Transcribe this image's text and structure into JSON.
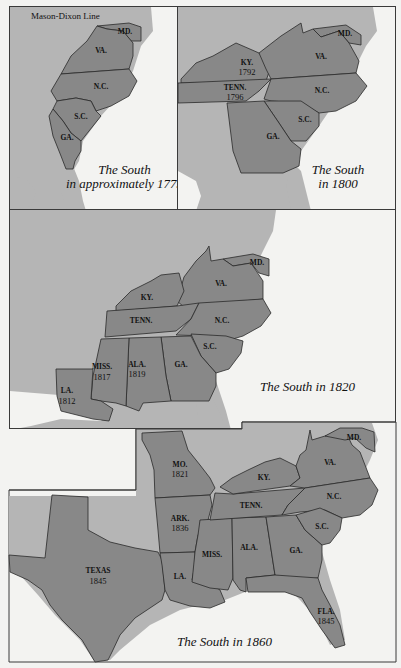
{
  "colors": {
    "water": "#f3f3f1",
    "land": "#b5b5b5",
    "state": "#888888",
    "border": "#2a2a2a"
  },
  "maps": [
    {
      "id": "south-1775",
      "caption_line1": "The South",
      "caption_line2": "in approximately 1775",
      "annotation": "Mason-Dixon Line",
      "states": [
        {
          "abbr": "MD.",
          "year": ""
        },
        {
          "abbr": "VA.",
          "year": ""
        },
        {
          "abbr": "N.C.",
          "year": ""
        },
        {
          "abbr": "S.C.",
          "year": ""
        },
        {
          "abbr": "GA.",
          "year": ""
        }
      ]
    },
    {
      "id": "south-1800",
      "caption_line1": "The South",
      "caption_line2": "in 1800",
      "states": [
        {
          "abbr": "MD.",
          "year": ""
        },
        {
          "abbr": "VA.",
          "year": ""
        },
        {
          "abbr": "KY.",
          "year": "1792"
        },
        {
          "abbr": "TENN.",
          "year": "1796"
        },
        {
          "abbr": "N.C.",
          "year": ""
        },
        {
          "abbr": "S.C.",
          "year": ""
        },
        {
          "abbr": "GA.",
          "year": ""
        }
      ]
    },
    {
      "id": "south-1820",
      "caption": "The South in 1820",
      "states": [
        {
          "abbr": "MD.",
          "year": ""
        },
        {
          "abbr": "VA.",
          "year": ""
        },
        {
          "abbr": "KY.",
          "year": ""
        },
        {
          "abbr": "TENN.",
          "year": ""
        },
        {
          "abbr": "N.C.",
          "year": ""
        },
        {
          "abbr": "S.C.",
          "year": ""
        },
        {
          "abbr": "GA.",
          "year": ""
        },
        {
          "abbr": "ALA.",
          "year": "1819"
        },
        {
          "abbr": "MISS.",
          "year": "1817"
        },
        {
          "abbr": "LA.",
          "year": "1812"
        }
      ]
    },
    {
      "id": "south-1860",
      "caption": "The South in 1860",
      "states": [
        {
          "abbr": "MD.",
          "year": ""
        },
        {
          "abbr": "VA.",
          "year": ""
        },
        {
          "abbr": "KY.",
          "year": ""
        },
        {
          "abbr": "MO.",
          "year": "1821"
        },
        {
          "abbr": "TENN.",
          "year": ""
        },
        {
          "abbr": "N.C.",
          "year": ""
        },
        {
          "abbr": "S.C.",
          "year": ""
        },
        {
          "abbr": "ARK.",
          "year": "1836"
        },
        {
          "abbr": "MISS.",
          "year": ""
        },
        {
          "abbr": "ALA.",
          "year": ""
        },
        {
          "abbr": "GA.",
          "year": ""
        },
        {
          "abbr": "LA.",
          "year": ""
        },
        {
          "abbr": "TEXAS",
          "year": "1845"
        },
        {
          "abbr": "FLA.",
          "year": "1845"
        }
      ]
    }
  ]
}
